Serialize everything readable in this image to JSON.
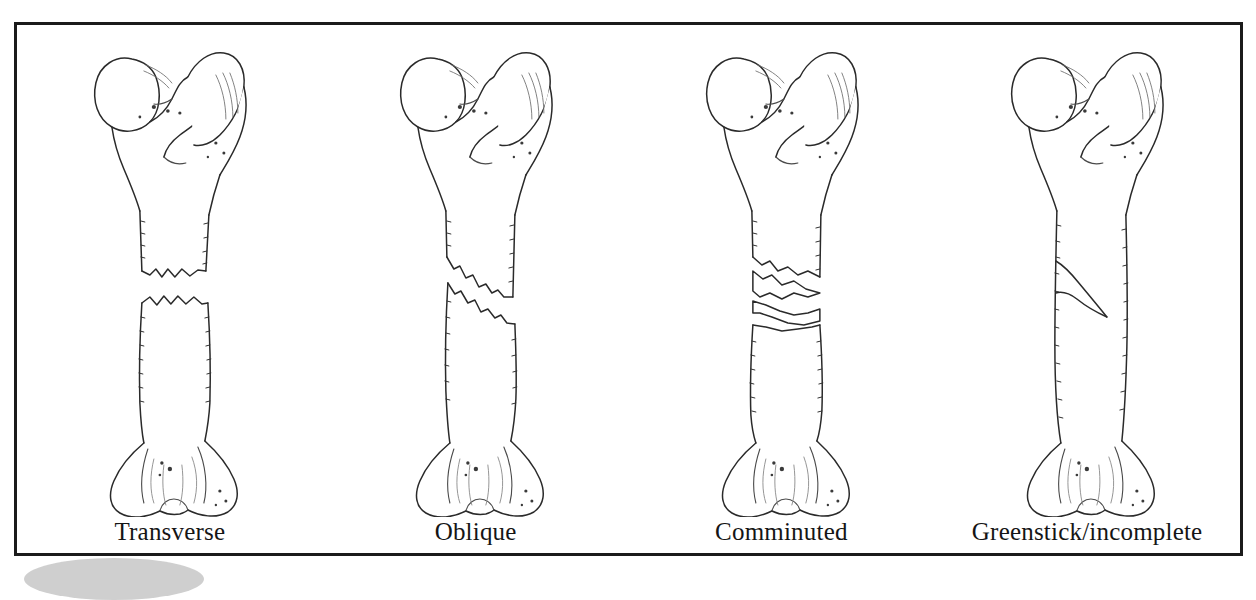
{
  "figure": {
    "frame_border_color": "#1b1b1b",
    "background_color": "#ffffff",
    "ink_color": "#2a2a2a",
    "shadow_color": "#bfbfbf"
  },
  "panels": [
    {
      "label": "Transverse",
      "fracture_type": "transverse",
      "description": "Horizontal jagged break straight across the femoral shaft with the two fragments separated by a gap"
    },
    {
      "label": "Oblique",
      "fracture_type": "oblique",
      "description": "Angled diagonal break running across the femoral shaft with the fragments offset"
    },
    {
      "label": "Comminuted",
      "fracture_type": "comminuted",
      "description": "Shaft shattered into several separate bone fragments at the fracture site"
    },
    {
      "label": "Greenstick/incomplete",
      "fracture_type": "greenstick",
      "description": "Incomplete crack that splits only part way through the shaft without separating it"
    }
  ],
  "anatomy": {
    "bone_name": "femur",
    "view": "anterior",
    "parts": [
      "head",
      "neck",
      "greater trochanter",
      "lesser trochanter",
      "shaft",
      "medial condyle",
      "lateral condyle"
    ]
  }
}
